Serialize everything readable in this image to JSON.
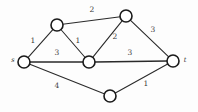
{
  "figure": {
    "width": 198,
    "height": 112,
    "background_color": "#fdfdfd",
    "edge_color": "#2a2a2a",
    "node_fill_color": "#ffffff",
    "node_stroke_color": "#1a1a1a",
    "label_color": "#3a3a3a"
  },
  "chart_data": {
    "type": "diagram",
    "diagram_kind": "weighted-undirected-graph",
    "title": "",
    "node_radius": 6,
    "nodes": [
      {
        "id": "s",
        "label": "s",
        "label_shown": true,
        "x": 24,
        "y": 62,
        "label_x": 13,
        "label_y": 60
      },
      {
        "id": "a",
        "label": "",
        "label_shown": false,
        "x": 57,
        "y": 25,
        "label_x": 57,
        "label_y": 25
      },
      {
        "id": "b",
        "label": "",
        "label_shown": false,
        "x": 126,
        "y": 16,
        "label_x": 126,
        "label_y": 16
      },
      {
        "id": "c",
        "label": "",
        "label_shown": false,
        "x": 89,
        "y": 62,
        "label_x": 89,
        "label_y": 62
      },
      {
        "id": "t",
        "label": "t",
        "label_shown": true,
        "x": 173,
        "y": 61,
        "label_x": 185,
        "label_y": 60
      },
      {
        "id": "d",
        "label": "",
        "label_shown": false,
        "x": 110,
        "y": 96,
        "label_x": 110,
        "label_y": 96
      }
    ],
    "edges": [
      {
        "from": "s",
        "to": "a",
        "weight": 1,
        "label_x": 33,
        "label_y": 41,
        "emphasis": false
      },
      {
        "from": "a",
        "to": "b",
        "weight": 2,
        "label_x": 92,
        "label_y": 10,
        "emphasis": false
      },
      {
        "from": "a",
        "to": "c",
        "weight": 1,
        "label_x": 78,
        "label_y": 41,
        "emphasis": false
      },
      {
        "from": "s",
        "to": "c",
        "weight": 3,
        "label_x": 57,
        "label_y": 53,
        "emphasis": true
      },
      {
        "from": "c",
        "to": "b",
        "weight": 2,
        "label_x": 115,
        "label_y": 37,
        "emphasis": false
      },
      {
        "from": "b",
        "to": "t",
        "weight": 3,
        "label_x": 153,
        "label_y": 30,
        "emphasis": false
      },
      {
        "from": "c",
        "to": "t",
        "weight": 3,
        "label_x": 130,
        "label_y": 53,
        "emphasis": true
      },
      {
        "from": "s",
        "to": "d",
        "weight": 4,
        "label_x": 57,
        "label_y": 86,
        "emphasis": false
      },
      {
        "from": "d",
        "to": "t",
        "weight": 1,
        "label_x": 146,
        "label_y": 84,
        "emphasis": false
      }
    ],
    "weights": [
      1,
      2,
      1,
      3,
      2,
      3,
      3,
      4,
      1
    ],
    "node_labels": [
      "s",
      "t"
    ],
    "xlabel": "",
    "ylabel": "",
    "legend": []
  }
}
